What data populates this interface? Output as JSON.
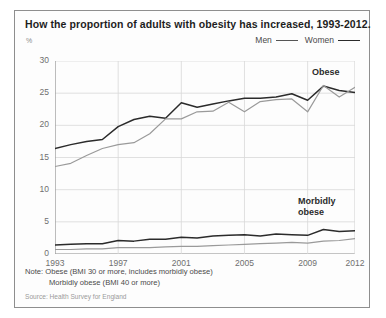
{
  "title": "How the proportion of adults with obesity has increased, 1993-2012.",
  "axis_unit": "%",
  "legend": [
    {
      "label": "Men",
      "key": "men"
    },
    {
      "label": "Women",
      "key": "women"
    }
  ],
  "annotations": {
    "obese": "Obese",
    "morbidly_line1": "Morbidly",
    "morbidly_line2": "obese"
  },
  "notes": {
    "line1": "Note: Obese (BMI 30 or more, includes morbidly obese)",
    "line2": "Morbidly obese (BMI 40 or more)"
  },
  "source": "Source: Health Survey for England",
  "colors": {
    "women": "#2b2b2b",
    "men": "#9a9a9a",
    "grid": "#d8d8d8",
    "axis": "#8a8a8a",
    "border": "#8e8e8e"
  },
  "chart_data": {
    "type": "line",
    "title": "How the proportion of adults with obesity has increased, 1993-2012.",
    "xlabel": "",
    "ylabel": "%",
    "xlim": [
      1993,
      2012
    ],
    "ylim": [
      0,
      30
    ],
    "yticks": [
      0,
      5,
      10,
      15,
      20,
      25,
      30
    ],
    "xticks": [
      1993,
      1997,
      2001,
      2005,
      2009,
      2012
    ],
    "grid": true,
    "legend_position": "top-right",
    "x": [
      1993,
      1994,
      1995,
      1996,
      1997,
      1998,
      1999,
      2000,
      2001,
      2002,
      2003,
      2004,
      2005,
      2006,
      2007,
      2008,
      2009,
      2010,
      2011,
      2012
    ],
    "series": [
      {
        "name": "Women obese",
        "group": "obese",
        "sex": "women",
        "color": "#2b2b2b",
        "values": [
          16.4,
          17.0,
          17.5,
          17.8,
          19.8,
          20.9,
          21.4,
          21.1,
          23.5,
          22.8,
          23.3,
          23.8,
          24.2,
          24.2,
          24.4,
          24.9,
          23.9,
          26.1,
          25.4,
          25.1
        ]
      },
      {
        "name": "Men obese",
        "group": "obese",
        "sex": "men",
        "color": "#9a9a9a",
        "values": [
          13.6,
          14.1,
          15.3,
          16.4,
          17.0,
          17.3,
          18.7,
          21.0,
          21.0,
          22.1,
          22.2,
          23.6,
          22.1,
          23.7,
          24.0,
          24.1,
          22.1,
          26.2,
          24.4,
          25.9
        ]
      },
      {
        "name": "Women morbidly obese",
        "group": "morbidly_obese",
        "sex": "women",
        "color": "#2b2b2b",
        "values": [
          1.4,
          1.5,
          1.6,
          1.6,
          2.1,
          2.0,
          2.3,
          2.3,
          2.6,
          2.5,
          2.8,
          2.9,
          3.0,
          2.8,
          3.1,
          3.0,
          2.9,
          3.8,
          3.5,
          3.6
        ]
      },
      {
        "name": "Men morbidly obese",
        "group": "morbidly_obese",
        "sex": "men",
        "color": "#9a9a9a",
        "values": [
          0.7,
          0.7,
          0.8,
          0.8,
          1.0,
          1.0,
          1.0,
          1.1,
          1.2,
          1.2,
          1.3,
          1.4,
          1.5,
          1.6,
          1.7,
          1.8,
          1.7,
          2.0,
          2.1,
          2.4
        ]
      }
    ]
  }
}
